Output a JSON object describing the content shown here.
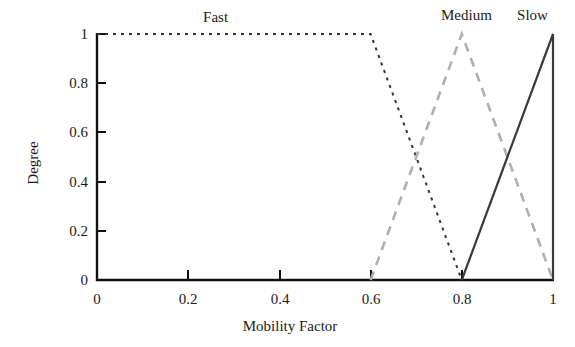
{
  "chart_data": {
    "type": "line",
    "title": "",
    "xlabel": "Mobility Factor",
    "ylabel": "Degree",
    "xlim": [
      0,
      1
    ],
    "ylim": [
      0,
      1
    ],
    "grid": false,
    "legend_position": "above-plot-inline",
    "xticks": [
      "0",
      "0.2",
      "0.4",
      "0.6",
      "0.8",
      "1"
    ],
    "xtick_values": [
      0,
      0.2,
      0.4,
      0.6,
      0.8,
      1
    ],
    "yticks": [
      "0",
      "0.2",
      "0.4",
      "0.6",
      "0.8",
      "1"
    ],
    "ytick_values": [
      0,
      0.2,
      0.4,
      0.6,
      0.8,
      1
    ],
    "series": [
      {
        "name": "Fast",
        "style": "dotted",
        "color": "#333333",
        "label_x": 0.26,
        "x": [
          0,
          0.6,
          0.8
        ],
        "values": [
          1,
          1,
          0
        ]
      },
      {
        "name": "Medium",
        "style": "dashed",
        "color": "#b0b0b0",
        "label_x": 0.81,
        "x": [
          0.6,
          0.8,
          1
        ],
        "values": [
          0,
          1,
          0
        ]
      },
      {
        "name": "Slow",
        "style": "solid",
        "color": "#3a3a3a",
        "label_x": 0.955,
        "x": [
          0.8,
          1,
          1
        ],
        "values": [
          0,
          1,
          0
        ]
      }
    ]
  },
  "axis": {
    "line_color": "#111111"
  }
}
